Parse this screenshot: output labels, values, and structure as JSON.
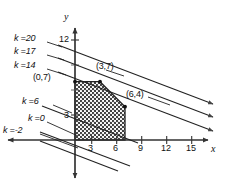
{
  "figure": {
    "axes": {
      "x_label": "x",
      "y_label": "y",
      "x_ticks": [
        "3",
        "6",
        "9",
        "12",
        "15"
      ],
      "x_tick_values": [
        3,
        6,
        9,
        12,
        15
      ],
      "y_ticks": [
        "3",
        "12"
      ],
      "y_tick_values": [
        3,
        12
      ],
      "xlim": [
        -9,
        18
      ],
      "ylim": [
        -5,
        13
      ],
      "grid": false
    },
    "vertex_labels": [
      {
        "text": "(0,7)",
        "x": 0,
        "y": 7
      },
      {
        "text": "(3,7)",
        "x": 3,
        "y": 7
      },
      {
        "text": "(6,4)",
        "x": 6,
        "y": 4
      }
    ],
    "k_lines": [
      {
        "label": "k =20",
        "k": 20
      },
      {
        "label": "k =17",
        "k": 17
      },
      {
        "label": "k =14",
        "k": 14
      },
      {
        "label": "k =6",
        "k": 6
      },
      {
        "label": "k =0",
        "k": 0
      },
      {
        "label": "k =-2",
        "k": -2
      }
    ],
    "region": {
      "name": "feasible-region",
      "vertices": [
        [
          0,
          0
        ],
        [
          0,
          7
        ],
        [
          3,
          7
        ],
        [
          6,
          4
        ],
        [
          6,
          0
        ]
      ],
      "fill": "hatched-dotted"
    },
    "colors": {
      "ink": "#111111",
      "axis": "#333333",
      "background": "#ffffff",
      "region_fill": "#8a8a8a"
    }
  }
}
